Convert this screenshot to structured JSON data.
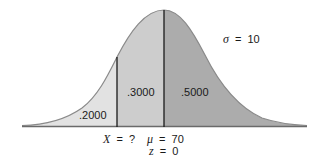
{
  "diagram": {
    "type": "normal-distribution",
    "sigma_label": {
      "symbol": "σ",
      "eq": "=",
      "value": "10"
    },
    "regions": [
      {
        "id": "left-tail",
        "label": ".2000",
        "color": "#e2e2e2"
      },
      {
        "id": "middle",
        "label": ".3000",
        "color": "#cdcdcd"
      },
      {
        "id": "right-half",
        "label": ".5000",
        "color": "#acacac"
      }
    ],
    "axis_labels": {
      "x_label": {
        "symbol": "X",
        "eq": "=",
        "value": "?"
      },
      "mu_label": {
        "symbol": "μ",
        "eq": "=",
        "value": "70"
      },
      "z_label": {
        "symbol": "z",
        "eq": "=",
        "value": "0"
      }
    },
    "colors": {
      "curve_outline": "#8a8a8a",
      "divider_lines": "#1a1a1a",
      "baseline": "#6a6a6a"
    }
  }
}
